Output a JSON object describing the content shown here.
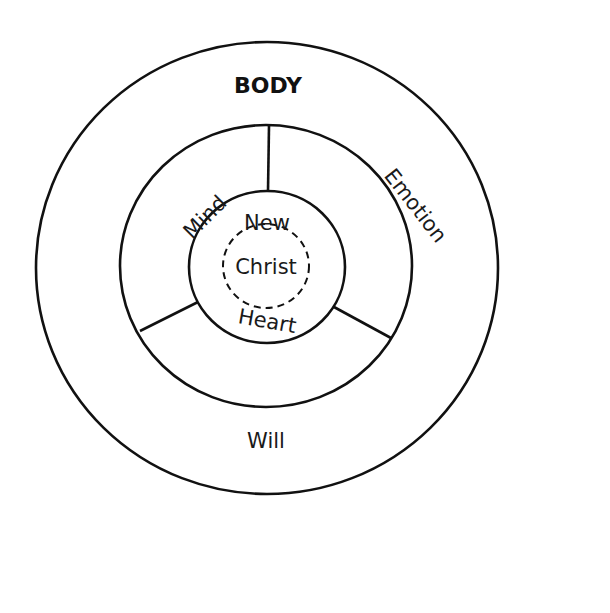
{
  "diagram": {
    "title": "BODY",
    "regions": {
      "mind": "Mind",
      "emotion": "Emotion",
      "will": "Will"
    },
    "core": {
      "top": "New",
      "center": "Christ",
      "bottom": "Heart"
    },
    "colors": {
      "stroke": "#111111",
      "background": "#ffffff"
    }
  }
}
